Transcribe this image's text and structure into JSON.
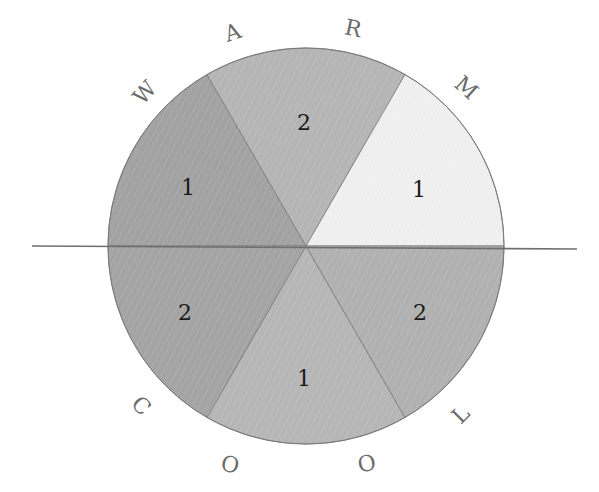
{
  "diagram": {
    "center": {
      "x": 306,
      "y": 246
    },
    "radius": 198,
    "divider_line": {
      "x1": 32,
      "y1": 246,
      "x2": 577,
      "y2": 249,
      "color": "#6f6f6f"
    },
    "outline_color": "#7a7a7a",
    "sectors": [
      {
        "id": "upper-left",
        "start_deg": 120,
        "end_deg": 180,
        "value": "1",
        "fill": "#a3a3a3",
        "label_pos": {
          "x": 188,
          "y": 195
        }
      },
      {
        "id": "upper-mid",
        "start_deg": 60,
        "end_deg": 120,
        "value": "2",
        "fill": "#b6b6b6",
        "label_pos": {
          "x": 304,
          "y": 130
        }
      },
      {
        "id": "upper-right",
        "start_deg": 0,
        "end_deg": 60,
        "value": "1",
        "fill": "#f0f0f0",
        "label_pos": {
          "x": 419,
          "y": 197
        }
      },
      {
        "id": "lower-left",
        "start_deg": 180,
        "end_deg": 240,
        "value": "2",
        "fill": "#a5a5a5",
        "label_pos": {
          "x": 185,
          "y": 320
        }
      },
      {
        "id": "lower-mid",
        "start_deg": 240,
        "end_deg": 300,
        "value": "1",
        "fill": "#b7b7b7",
        "label_pos": {
          "x": 304,
          "y": 386
        }
      },
      {
        "id": "lower-right",
        "start_deg": 300,
        "end_deg": 360,
        "value": "2",
        "fill": "#b2b2b2",
        "label_pos": {
          "x": 420,
          "y": 320
        }
      }
    ],
    "top_word": {
      "text": "WARM",
      "letters": [
        {
          "char": "W",
          "x": 145,
          "y": 100,
          "rotate": -48
        },
        {
          "char": "A",
          "x": 233,
          "y": 40,
          "rotate": -18
        },
        {
          "char": "R",
          "x": 353,
          "y": 36,
          "rotate": 12
        },
        {
          "char": "M",
          "x": 466,
          "y": 95,
          "rotate": 42
        }
      ]
    },
    "bottom_word": {
      "text": "COOL",
      "letters": [
        {
          "char": "C",
          "x": 141,
          "y": 413,
          "rotate": 45
        },
        {
          "char": "O",
          "x": 230,
          "y": 472,
          "rotate": 12
        },
        {
          "char": "O",
          "x": 367,
          "y": 471,
          "rotate": -12
        },
        {
          "char": "L",
          "x": 461,
          "y": 422,
          "rotate": -45
        }
      ]
    }
  }
}
